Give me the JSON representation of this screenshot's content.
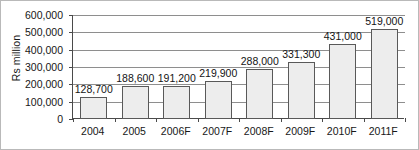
{
  "chart_data": {
    "type": "bar",
    "title": "",
    "subtitle": "",
    "xlabel": "",
    "ylabel": "Rs million",
    "categories": [
      "2004",
      "2005",
      "2006F",
      "2007F",
      "2008F",
      "2009F",
      "2010F",
      "2011F"
    ],
    "values": [
      128700,
      188600,
      191200,
      219900,
      288000,
      331300,
      431000,
      519000
    ],
    "value_labels": [
      "128,700",
      "188,600",
      "191,200",
      "219,900",
      "288,000",
      "331,300",
      "431,000",
      "519,000"
    ],
    "ylim": [
      0,
      600000
    ],
    "ytick_values": [
      0,
      100000,
      200000,
      300000,
      400000,
      500000,
      600000
    ],
    "ytick_labels": [
      "0",
      "100,000",
      "200,000",
      "300,000",
      "400,000",
      "500,000",
      "600,000"
    ],
    "grid": true,
    "legend": false,
    "legend_position": "none",
    "series": [
      {
        "name": "Rs million",
        "values": [
          128700,
          188600,
          191200,
          219900,
          288000,
          331300,
          431000,
          519000
        ]
      }
    ],
    "colors": {
      "bar_fill": "#ededed",
      "bar_border": "#595959",
      "gridline": "#8e8e8e",
      "axis": "#4a4a4a",
      "text": "#171717",
      "frame": "#b9b9b9",
      "background": "#ffffff"
    }
  }
}
